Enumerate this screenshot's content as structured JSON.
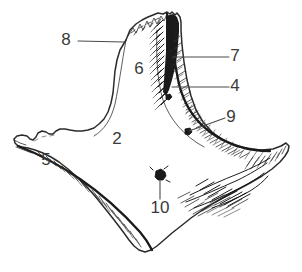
{
  "figure": {
    "background_color": "#ffffff",
    "ink_color": "#2b2b2b",
    "label_color": "#3a3a3a",
    "width": 302,
    "height": 272,
    "technique": "pen-and-ink line drawing with hatched shading"
  },
  "labels": [
    {
      "id": "label-8",
      "text": "8",
      "x": 66,
      "y": 41,
      "leader": "horizontal line from label to upper-left contour notch",
      "leader_from": [
        78,
        41
      ],
      "leader_to": [
        124,
        42
      ]
    },
    {
      "id": "label-6",
      "text": "6",
      "x": 139,
      "y": 70,
      "leader": "none",
      "leader_from": null,
      "leader_to": null
    },
    {
      "id": "label-7",
      "text": "7",
      "x": 235,
      "y": 57,
      "leader": "horizontal line from label to dark hatched crest band",
      "leader_from": [
        229,
        57
      ],
      "leader_to": [
        173,
        57
      ]
    },
    {
      "id": "label-4",
      "text": "4",
      "x": 235,
      "y": 87,
      "leader": "horizontal line from label to hatched ridge",
      "leader_from": [
        229,
        87
      ],
      "leader_to": [
        172,
        87
      ]
    },
    {
      "id": "label-9",
      "text": "9",
      "x": 231,
      "y": 118,
      "leader": "diagonal line from label down-left to small dark mark on crest",
      "leader_from": [
        225,
        118
      ],
      "leader_to": [
        189,
        131
      ]
    },
    {
      "id": "label-2",
      "text": "2",
      "x": 117,
      "y": 140,
      "leader": "none",
      "leader_from": null,
      "leader_to": null
    },
    {
      "id": "label-5",
      "text": "5",
      "x": 46,
      "y": 161,
      "leader": "none",
      "leader_from": null,
      "leader_to": null
    },
    {
      "id": "label-10",
      "text": "10",
      "x": 153,
      "y": 209,
      "leader": "vertical line from label up to dark foramen blob",
      "leader_from": [
        160,
        199
      ],
      "leader_to": [
        160,
        180
      ]
    }
  ],
  "features": [
    {
      "id": "foramen",
      "name": "nutrient-foramen",
      "description": "small dark irregular blob in lower-central area",
      "x": 160,
      "y": 175
    },
    {
      "id": "crest-mark",
      "name": "crest-mark",
      "description": "small dark mark on hatched crest",
      "x": 188,
      "y": 132
    },
    {
      "id": "serrated-top",
      "name": "serrated-superior-margin",
      "description": "jagged broken upper edge at top of the element"
    },
    {
      "id": "dark-band",
      "name": "dark-vertical-band",
      "description": "heavily inked vertical band along the upper crest"
    }
  ]
}
